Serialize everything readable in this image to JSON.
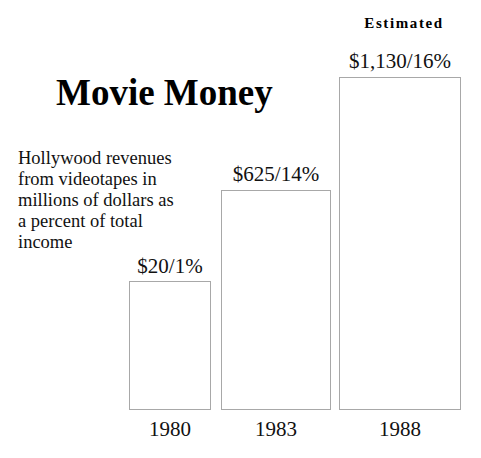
{
  "figure": {
    "width": 481,
    "height": 458,
    "background_color": "#ffffff",
    "text_color": "#111111",
    "bar_border_color": "#a8a8a8",
    "bar_fill_color": "#ffffff"
  },
  "title": "Movie Money",
  "subtitle_lines": [
    "Hollywood revenues",
    "from videotapes in",
    "millions of dollars as",
    "a percent of total",
    "income"
  ],
  "subtitle_text": "Hollywood revenues from videotapes in millions of dollars as a percent of total income",
  "annotations": {
    "estimated_note": "Estimated"
  },
  "bars": [
    {
      "category": "1980",
      "value_label": "$20/1%",
      "revenue_millions": 20,
      "percent_of_total_income": 1,
      "note": ""
    },
    {
      "category": "1983",
      "value_label": "$625/14%",
      "revenue_millions": 625,
      "percent_of_total_income": 14,
      "note": ""
    },
    {
      "category": "1988",
      "value_label": "$1,130/16%",
      "revenue_millions": 1130,
      "percent_of_total_income": 16,
      "note": "Estimated"
    }
  ],
  "chart_data": {
    "type": "bar",
    "title": "Movie Money",
    "subtitle": "Hollywood revenues from videotapes in millions of dollars as a percent of total income",
    "categories": [
      "1980",
      "1983",
      "1988"
    ],
    "values": [
      20,
      625,
      1130
    ],
    "data_labels": [
      "$20/1%",
      "$625/14%",
      "$1,130/16%"
    ],
    "series": [
      {
        "name": "Revenue ($ millions)",
        "values": [
          20,
          625,
          1130
        ]
      },
      {
        "name": "Percent of total income",
        "values": [
          1,
          14,
          16
        ]
      }
    ],
    "xlabel": "",
    "ylabel": "",
    "ylim": [
      0,
      1130
    ],
    "grid": false,
    "legend": "none",
    "annotations": [
      {
        "text": "Estimated",
        "applies_to_category": "1988"
      }
    ],
    "bar_widths_vary": true
  }
}
